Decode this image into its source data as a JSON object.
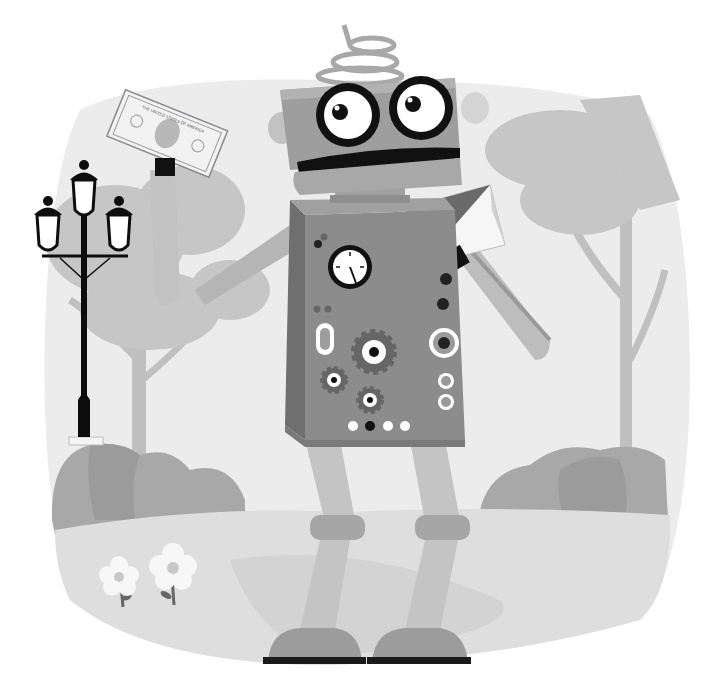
{
  "illustration": {
    "subject": "cartoon robot holding dollar bill and envelope in a park",
    "background_color": "#ffffff",
    "palette": {
      "sky": "#ececec",
      "tree_light": "#c8c8c8",
      "tree_trunk": "#bdbdbd",
      "bush": "#a9a9a9",
      "bush_dark": "#9a9a9a",
      "ground": "#dcdcdc",
      "path": "#d0d0d0",
      "robot_body": "#8c8c8c",
      "robot_body_side": "#6e6e6e",
      "robot_head": "#9e9e9e",
      "robot_limb": "#bcbcbc",
      "robot_joint": "#a5a5a5",
      "robot_foot": "#9a9a9a",
      "ink": "#111111",
      "white": "#ffffff",
      "lamp": "#0d0d0d"
    },
    "elements": {
      "robot": {
        "head": {
          "eyes": 2,
          "mouth": "open smile",
          "antenna": "spring coil",
          "ears": 2
        },
        "torso": {
          "gauge": 1,
          "gears": 3,
          "lights_bottom": 4,
          "side_rings": 4
        },
        "left_hand_item": "dollar bill",
        "right_hand_item": "envelope",
        "legs": 2
      },
      "street_lamp": {
        "lanterns": 3
      },
      "trees": 3,
      "bushes": 2,
      "flowers": 2
    },
    "dollar_bill_text": "THE UNITED STATES OF AMERICA"
  }
}
